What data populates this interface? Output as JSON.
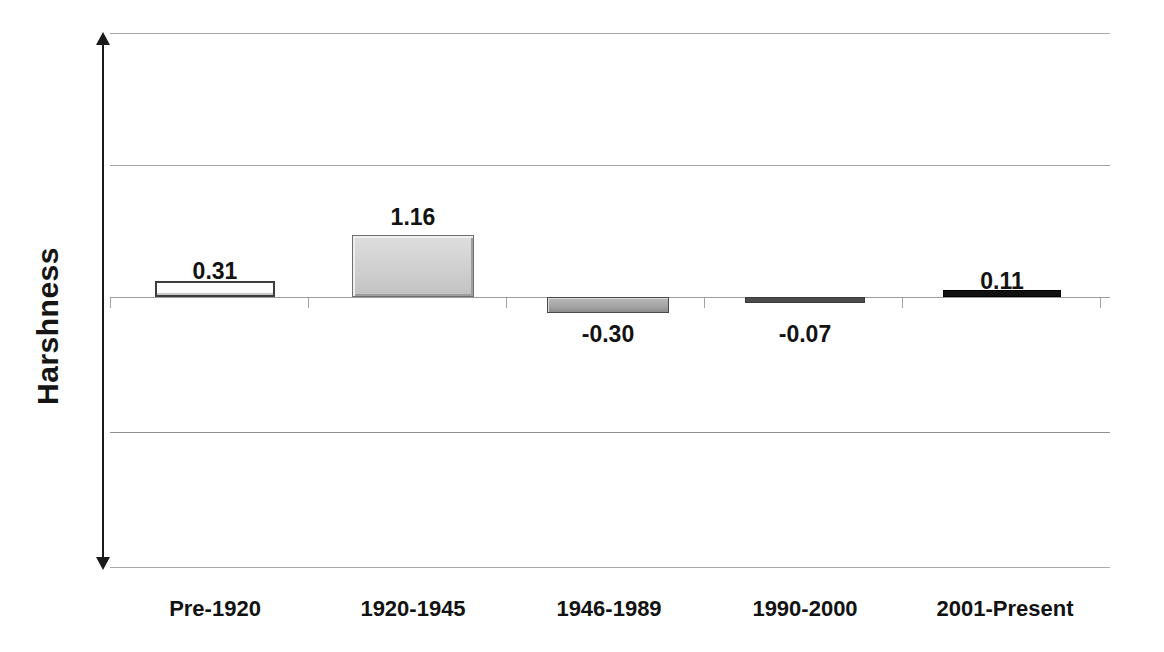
{
  "chart_data": {
    "type": "bar",
    "title": "",
    "xlabel": "",
    "ylabel": "Harshness",
    "categories": [
      "Pre-1920",
      "1920-1945",
      "1946-1989",
      "1990-2000",
      "2001-Present"
    ],
    "values": [
      0.31,
      1.16,
      -0.3,
      -0.07,
      0.11
    ],
    "value_labels": [
      "0.31",
      "1.16",
      "-0.30",
      "-0.07",
      "0.11"
    ],
    "ylim": [
      -2.55,
      2.55
    ],
    "grid": true,
    "gridlines": [
      2.55,
      1.98,
      -1.98,
      -2.55
    ],
    "legend": "none",
    "axis_style": "double-headed-arrow",
    "bar_styles": [
      "outline-white",
      "bevel-light-gray",
      "bevel-dark-gray",
      "thin-dark-gray",
      "solid-black"
    ]
  },
  "axis": {
    "y_title": "Harshness"
  },
  "bars": [
    {
      "category": "Pre-1920",
      "value": 0.31,
      "label": "0.31",
      "style": "style-outline",
      "left": 45,
      "width": 120,
      "height": 16,
      "direction": "up",
      "label_left": 45,
      "label_width": 120,
      "label_top": 228
    },
    {
      "category": "1920-1945",
      "value": 1.16,
      "label": "1.16",
      "style": "style-bevel",
      "left": 242,
      "width": 122,
      "height": 62,
      "direction": "up",
      "label_left": 242,
      "label_width": 122,
      "label_top": 174
    },
    {
      "category": "1946-1989",
      "value": -0.3,
      "label": "-0.30",
      "style": "style-bevel-dark",
      "left": 437,
      "width": 122,
      "height": 16,
      "direction": "down",
      "label_left": 437,
      "label_width": 122,
      "label_top": 291
    },
    {
      "category": "1990-2000",
      "value": -0.07,
      "label": "-0.07",
      "style": "style-thin-dark",
      "left": 635,
      "width": 120,
      "height": 6,
      "direction": "down",
      "label_left": 635,
      "label_width": 120,
      "label_top": 291
    },
    {
      "category": "2001-Present",
      "value": 0.11,
      "label": "0.11",
      "style": "style-solid-black",
      "left": 833,
      "width": 118,
      "height": 7,
      "direction": "up",
      "label_left": 833,
      "label_width": 118,
      "label_top": 238
    }
  ],
  "category_labels": [
    {
      "text": "Pre-1920",
      "left": 20,
      "width": 170
    },
    {
      "text": "1920-1945",
      "left": 218,
      "width": 170
    },
    {
      "text": "1946-1989",
      "left": 414,
      "width": 170
    },
    {
      "text": "1990-2000",
      "left": 610,
      "width": 170
    },
    {
      "text": "2001-Present",
      "left": 802,
      "width": 186
    }
  ],
  "axis_ticks": [
    {
      "left": 0
    },
    {
      "left": 198
    },
    {
      "left": 396
    },
    {
      "left": 594
    },
    {
      "left": 792
    },
    {
      "left": 990
    }
  ],
  "colors": {
    "background": "#ffffff",
    "gridline": "#9a9a9a",
    "axis": "#1a1a1a",
    "text": "#121212",
    "bar_light": "#cfcfcf",
    "bar_dark": "#a4a4a4",
    "bar_black": "#111111"
  }
}
